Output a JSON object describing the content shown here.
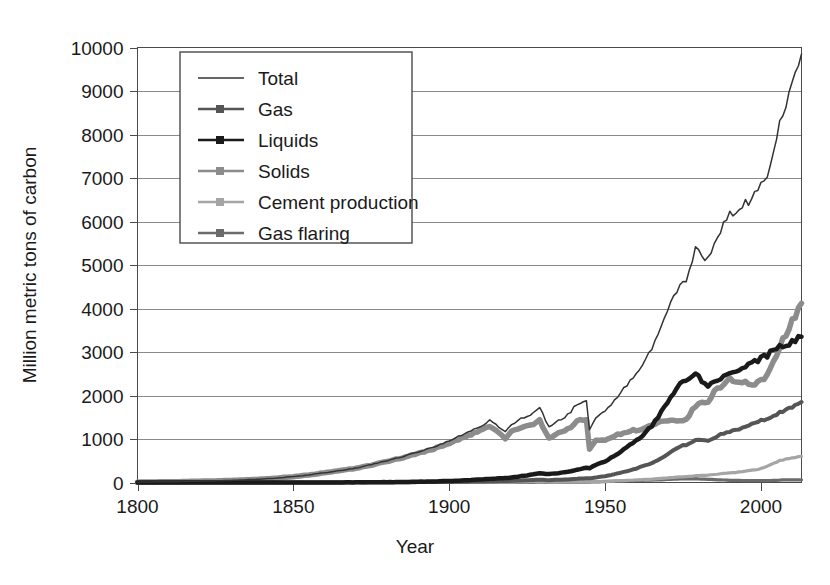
{
  "chart_data": {
    "type": "line",
    "title": "",
    "xlabel": "Year",
    "ylabel": "Million metric tons of carbon",
    "xlim": [
      1800,
      2013
    ],
    "ylim": [
      0,
      10000
    ],
    "xticks": [
      1800,
      1850,
      1900,
      1950,
      2000
    ],
    "yticks": [
      0,
      1000,
      2000,
      3000,
      4000,
      5000,
      6000,
      7000,
      8000,
      9000,
      10000
    ],
    "xtick_labels": [
      "1800",
      "1850",
      "1900",
      "1950",
      "2000"
    ],
    "ytick_labels": [
      "0",
      "1000",
      "2000",
      "3000",
      "4000",
      "5000",
      "6000",
      "7000",
      "8000",
      "9000",
      "10000"
    ],
    "grid": true,
    "legend_position": "upper-left-inside",
    "legend_entries": [
      "Total",
      "Gas",
      "Liquids",
      "Solids",
      "Cement production",
      "Gas flaring"
    ],
    "colors": {
      "total": "#333333",
      "gas": "#555555",
      "liquids": "#1a1a1a",
      "solids": "#8c8c8c",
      "cement": "#a5a5a5",
      "gas_flaring": "#6b6b6b",
      "gridline": "#8a8a8a",
      "axis": "#4a4a4a",
      "background": "#ffffff"
    },
    "x": [
      1800,
      1805,
      1810,
      1815,
      1820,
      1825,
      1830,
      1835,
      1840,
      1845,
      1850,
      1855,
      1860,
      1865,
      1870,
      1875,
      1880,
      1885,
      1890,
      1895,
      1900,
      1905,
      1910,
      1913,
      1916,
      1918,
      1920,
      1923,
      1926,
      1929,
      1932,
      1935,
      1938,
      1941,
      1944,
      1945,
      1947,
      1950,
      1953,
      1956,
      1959,
      1962,
      1965,
      1968,
      1971,
      1974,
      1976,
      1979,
      1981,
      1983,
      1985,
      1987,
      1990,
      1992,
      1995,
      1998,
      2000,
      2002,
      2004,
      2006,
      2008,
      2010,
      2012,
      2013
    ],
    "series": [
      {
        "name": "Total",
        "color": "#333333",
        "values": [
          8,
          12,
          17,
          23,
          30,
          38,
          48,
          62,
          80,
          105,
          135,
          175,
          225,
          275,
          330,
          410,
          500,
          590,
          700,
          810,
          960,
          1120,
          1300,
          1420,
          1280,
          1160,
          1340,
          1480,
          1550,
          1720,
          1280,
          1430,
          1550,
          1800,
          1900,
          1200,
          1500,
          1630,
          1900,
          2170,
          2430,
          2690,
          3100,
          3600,
          4100,
          4570,
          4700,
          5350,
          5200,
          5100,
          5440,
          5760,
          6150,
          6150,
          6400,
          6630,
          6790,
          6980,
          7600,
          8230,
          8740,
          9170,
          9600,
          9850
        ]
      },
      {
        "name": "Gas",
        "color": "#555555",
        "values": [
          0,
          0,
          0,
          0,
          0,
          0,
          0,
          0,
          0,
          0,
          0,
          0,
          1,
          2,
          3,
          4,
          5,
          7,
          9,
          11,
          14,
          18,
          25,
          30,
          33,
          35,
          40,
          48,
          55,
          65,
          55,
          62,
          72,
          85,
          100,
          95,
          115,
          145,
          190,
          240,
          300,
          370,
          450,
          560,
          700,
          830,
          870,
          980,
          980,
          970,
          1030,
          1100,
          1180,
          1210,
          1290,
          1360,
          1420,
          1460,
          1530,
          1600,
          1680,
          1740,
          1820,
          1850
        ]
      },
      {
        "name": "Liquids",
        "color": "#1a1a1a",
        "values": [
          0,
          0,
          0,
          0,
          0,
          0,
          0,
          0,
          0,
          0,
          0,
          0,
          1,
          2,
          3,
          5,
          8,
          12,
          18,
          25,
          35,
          50,
          70,
          85,
          95,
          100,
          115,
          145,
          175,
          210,
          195,
          215,
          245,
          290,
          340,
          330,
          410,
          480,
          620,
          760,
          910,
          1080,
          1300,
          1610,
          1950,
          2300,
          2340,
          2540,
          2350,
          2240,
          2280,
          2400,
          2520,
          2540,
          2680,
          2790,
          2850,
          2920,
          3050,
          3120,
          3160,
          3230,
          3320,
          3350
        ]
      },
      {
        "name": "Solids",
        "color": "#8c8c8c",
        "values": [
          8,
          12,
          17,
          23,
          30,
          38,
          48,
          62,
          80,
          105,
          135,
          175,
          224,
          272,
          325,
          400,
          485,
          570,
          670,
          770,
          905,
          1040,
          1195,
          1290,
          1140,
          1010,
          1170,
          1270,
          1300,
          1430,
          1020,
          1140,
          1220,
          1410,
          1450,
          760,
          960,
          990,
          1070,
          1150,
          1200,
          1220,
          1320,
          1390,
          1410,
          1400,
          1450,
          1760,
          1820,
          1850,
          2080,
          2200,
          2390,
          2330,
          2300,
          2230,
          2340,
          2460,
          2780,
          3130,
          3420,
          3700,
          3990,
          4120
        ]
      },
      {
        "name": "Cement production",
        "color": "#a5a5a5",
        "values": [
          0,
          0,
          0,
          0,
          0,
          0,
          0,
          0,
          0,
          0,
          0,
          0,
          0,
          0,
          1,
          1,
          2,
          2,
          3,
          4,
          5,
          7,
          9,
          11,
          9,
          8,
          11,
          14,
          17,
          20,
          13,
          16,
          20,
          22,
          18,
          14,
          20,
          26,
          35,
          45,
          55,
          65,
          78,
          95,
          115,
          130,
          135,
          155,
          160,
          170,
          185,
          200,
          220,
          230,
          260,
          290,
          320,
          370,
          440,
          500,
          540,
          570,
          590,
          600
        ]
      },
      {
        "name": "Gas flaring",
        "color": "#6b6b6b",
        "values": [
          0,
          0,
          0,
          0,
          0,
          0,
          0,
          0,
          0,
          0,
          0,
          0,
          0,
          0,
          0,
          0,
          0,
          0,
          0,
          0,
          1,
          1,
          2,
          3,
          3,
          3,
          4,
          5,
          6,
          7,
          6,
          7,
          8,
          9,
          10,
          10,
          12,
          23,
          30,
          37,
          44,
          50,
          56,
          62,
          72,
          80,
          82,
          88,
          80,
          72,
          65,
          60,
          52,
          48,
          44,
          42,
          40,
          42,
          48,
          55,
          60,
          62,
          62,
          62
        ]
      }
    ]
  }
}
